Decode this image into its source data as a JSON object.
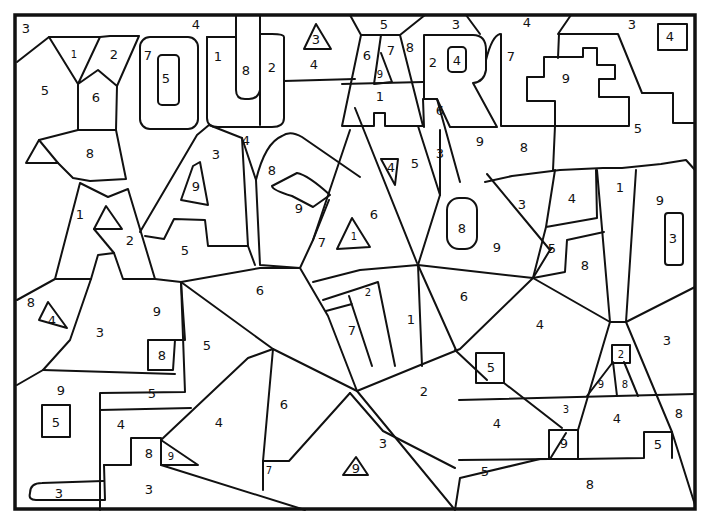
{
  "page": {
    "frame": {
      "x": 14,
      "y": 14,
      "w": 682,
      "h": 496
    },
    "line_color": "#111111",
    "background": "#ffffff"
  },
  "numbers": [
    {
      "n": "3",
      "x": 26,
      "y": 28
    },
    {
      "n": "4",
      "x": 196,
      "y": 24
    },
    {
      "n": "5",
      "x": 384,
      "y": 24
    },
    {
      "n": "3",
      "x": 456,
      "y": 24
    },
    {
      "n": "4",
      "x": 527,
      "y": 22
    },
    {
      "n": "3",
      "x": 632,
      "y": 24
    },
    {
      "n": "4",
      "x": 670,
      "y": 36
    },
    {
      "n": "3",
      "x": 316,
      "y": 39
    },
    {
      "n": "1",
      "x": 74,
      "y": 54,
      "sm": true
    },
    {
      "n": "2",
      "x": 114,
      "y": 54
    },
    {
      "n": "7",
      "x": 148,
      "y": 55
    },
    {
      "n": "5",
      "x": 166,
      "y": 78
    },
    {
      "n": "1",
      "x": 218,
      "y": 56
    },
    {
      "n": "8",
      "x": 246,
      "y": 70
    },
    {
      "n": "2",
      "x": 272,
      "y": 67
    },
    {
      "n": "4",
      "x": 314,
      "y": 64
    },
    {
      "n": "6",
      "x": 367,
      "y": 55
    },
    {
      "n": "7",
      "x": 391,
      "y": 50
    },
    {
      "n": "8",
      "x": 410,
      "y": 47
    },
    {
      "n": "9",
      "x": 380,
      "y": 74,
      "sm": true
    },
    {
      "n": "2",
      "x": 433,
      "y": 62
    },
    {
      "n": "4",
      "x": 457,
      "y": 60
    },
    {
      "n": "7",
      "x": 511,
      "y": 56
    },
    {
      "n": "9",
      "x": 566,
      "y": 78
    },
    {
      "n": "5",
      "x": 45,
      "y": 90
    },
    {
      "n": "6",
      "x": 96,
      "y": 97
    },
    {
      "n": "1",
      "x": 380,
      "y": 96
    },
    {
      "n": "6",
      "x": 440,
      "y": 110
    },
    {
      "n": "5",
      "x": 638,
      "y": 128
    },
    {
      "n": "4",
      "x": 246,
      "y": 140
    },
    {
      "n": "3",
      "x": 216,
      "y": 154
    },
    {
      "n": "9",
      "x": 480,
      "y": 141
    },
    {
      "n": "8",
      "x": 524,
      "y": 147
    },
    {
      "n": "8",
      "x": 90,
      "y": 153
    },
    {
      "n": "8",
      "x": 272,
      "y": 170
    },
    {
      "n": "4",
      "x": 391,
      "y": 167
    },
    {
      "n": "5",
      "x": 415,
      "y": 163
    },
    {
      "n": "3",
      "x": 440,
      "y": 153
    },
    {
      "n": "9",
      "x": 196,
      "y": 186
    },
    {
      "n": "3",
      "x": 522,
      "y": 204
    },
    {
      "n": "4",
      "x": 572,
      "y": 198
    },
    {
      "n": "1",
      "x": 620,
      "y": 187
    },
    {
      "n": "9",
      "x": 660,
      "y": 200
    },
    {
      "n": "9",
      "x": 299,
      "y": 208
    },
    {
      "n": "1",
      "x": 80,
      "y": 214
    },
    {
      "n": "6",
      "x": 374,
      "y": 214
    },
    {
      "n": "8",
      "x": 462,
      "y": 228
    },
    {
      "n": "7",
      "x": 322,
      "y": 242
    },
    {
      "n": "1",
      "x": 354,
      "y": 236,
      "sm": true
    },
    {
      "n": "2",
      "x": 130,
      "y": 240
    },
    {
      "n": "5",
      "x": 552,
      "y": 248
    },
    {
      "n": "9",
      "x": 497,
      "y": 247
    },
    {
      "n": "3",
      "x": 673,
      "y": 238
    },
    {
      "n": "5",
      "x": 185,
      "y": 250
    },
    {
      "n": "8",
      "x": 585,
      "y": 265
    },
    {
      "n": "6",
      "x": 260,
      "y": 290
    },
    {
      "n": "2",
      "x": 368,
      "y": 292,
      "sm": true
    },
    {
      "n": "6",
      "x": 464,
      "y": 296
    },
    {
      "n": "8",
      "x": 31,
      "y": 302
    },
    {
      "n": "9",
      "x": 157,
      "y": 311
    },
    {
      "n": "4",
      "x": 52,
      "y": 320
    },
    {
      "n": "1",
      "x": 411,
      "y": 319
    },
    {
      "n": "4",
      "x": 540,
      "y": 324
    },
    {
      "n": "3",
      "x": 100,
      "y": 332
    },
    {
      "n": "7",
      "x": 352,
      "y": 330
    },
    {
      "n": "5",
      "x": 207,
      "y": 345
    },
    {
      "n": "3",
      "x": 667,
      "y": 340
    },
    {
      "n": "8",
      "x": 162,
      "y": 355
    },
    {
      "n": "2",
      "x": 621,
      "y": 354,
      "sm": true
    },
    {
      "n": "5",
      "x": 491,
      "y": 367
    },
    {
      "n": "9",
      "x": 61,
      "y": 390
    },
    {
      "n": "5",
      "x": 152,
      "y": 393
    },
    {
      "n": "2",
      "x": 424,
      "y": 391
    },
    {
      "n": "9",
      "x": 601,
      "y": 384,
      "sm": true
    },
    {
      "n": "8",
      "x": 625,
      "y": 384,
      "sm": true
    },
    {
      "n": "6",
      "x": 284,
      "y": 404
    },
    {
      "n": "3",
      "x": 566,
      "y": 409,
      "sm": true
    },
    {
      "n": "8",
      "x": 679,
      "y": 413
    },
    {
      "n": "5",
      "x": 56,
      "y": 422
    },
    {
      "n": "4",
      "x": 121,
      "y": 424
    },
    {
      "n": "4",
      "x": 219,
      "y": 422
    },
    {
      "n": "4",
      "x": 497,
      "y": 423
    },
    {
      "n": "4",
      "x": 617,
      "y": 418
    },
    {
      "n": "3",
      "x": 383,
      "y": 443
    },
    {
      "n": "9",
      "x": 564,
      "y": 443
    },
    {
      "n": "5",
      "x": 658,
      "y": 444
    },
    {
      "n": "8",
      "x": 149,
      "y": 453
    },
    {
      "n": "9",
      "x": 171,
      "y": 456,
      "sm": true
    },
    {
      "n": "7",
      "x": 269,
      "y": 470,
      "sm": true
    },
    {
      "n": "9",
      "x": 356,
      "y": 468
    },
    {
      "n": "5",
      "x": 485,
      "y": 471
    },
    {
      "n": "8",
      "x": 590,
      "y": 484
    },
    {
      "n": "3",
      "x": 59,
      "y": 493
    },
    {
      "n": "3",
      "x": 149,
      "y": 489
    }
  ]
}
